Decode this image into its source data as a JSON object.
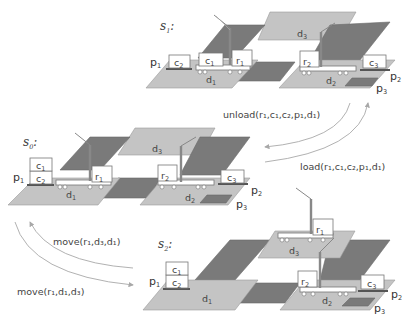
{
  "states": {
    "s0": {
      "label": "s",
      "sub": "0",
      "suffix": ":"
    },
    "s1": {
      "label": "s",
      "sub": "1",
      "suffix": ":"
    },
    "s2": {
      "label": "s",
      "sub": "2",
      "suffix": ":"
    }
  },
  "objects": {
    "pile1": {
      "t": "p",
      "s": "1"
    },
    "pile2": {
      "t": "p",
      "s": "2"
    },
    "pile3": {
      "t": "p",
      "s": "3"
    },
    "dock1": {
      "t": "d",
      "s": "1"
    },
    "dock2": {
      "t": "d",
      "s": "2"
    },
    "dock3": {
      "t": "d",
      "s": "3"
    },
    "cont1": {
      "t": "c",
      "s": "1"
    },
    "cont2": {
      "t": "c",
      "s": "2"
    },
    "cont3": {
      "t": "c",
      "s": "3"
    },
    "robot1": {
      "t": "r",
      "s": "1"
    },
    "robot2": {
      "t": "r",
      "s": "2"
    }
  },
  "actions": {
    "unload": {
      "name": "unload",
      "args": [
        "r1",
        "c1",
        "c2",
        "p1",
        "d1"
      ]
    },
    "load": {
      "name": "load",
      "args": [
        "r1",
        "c1",
        "c2",
        "p1",
        "d1"
      ]
    },
    "move_back": {
      "name": "move",
      "args": [
        "r1",
        "d3",
        "d1"
      ]
    },
    "move_fwd": {
      "name": "move",
      "args": [
        "r1",
        "d1",
        "d3"
      ]
    }
  },
  "action_text": {
    "unload": "unload(r₁,c₁,c₂,p₁,d₁)",
    "load": "load(r₁,c₁,c₂,p₁,d₁)",
    "move_back": "move(r₁,d₃,d₁)",
    "move_fwd": "move(r₁,d₁,d₃)"
  }
}
